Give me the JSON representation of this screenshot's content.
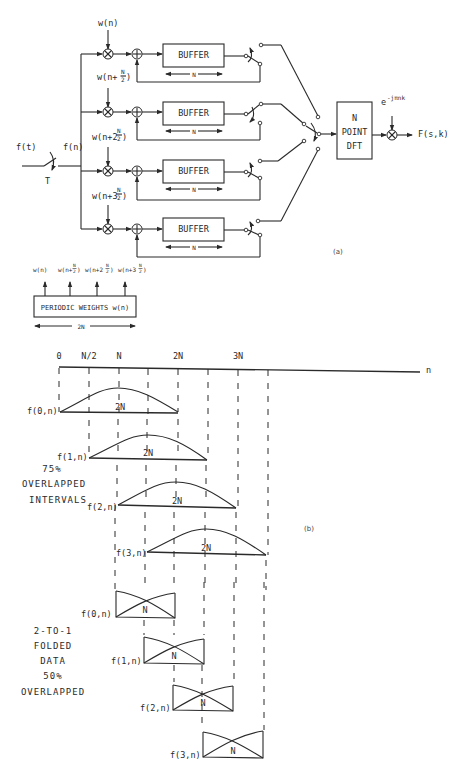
{
  "part_a": {
    "label": "(a)",
    "input_signal": "f(t)",
    "sampled_signal": "f(n)",
    "sampling_period": "T",
    "branches": [
      {
        "weight": "w(n)",
        "weight_base": "w(n",
        "weight_coef": "",
        "weight_suffix": ")",
        "buffer": "BUFFER",
        "length": "N"
      },
      {
        "weight": "w(n+N/2)",
        "weight_base": "w(n+",
        "weight_coef": "",
        "weight_suffix": ")",
        "buffer": "BUFFER",
        "length": "N"
      },
      {
        "weight": "w(n+2N/2)",
        "weight_base": "w(n+2",
        "weight_coef": "2",
        "weight_suffix": ")",
        "buffer": "BUFFER",
        "length": "N"
      },
      {
        "weight": "w(n+3N/2)",
        "weight_base": "w(n+3",
        "weight_coef": "3",
        "weight_suffix": ")",
        "buffer": "BUFFER",
        "length": "N"
      }
    ],
    "frac_num": "N",
    "frac_den": "2",
    "dft": {
      "line1": "N",
      "line2": "POINT",
      "line3": "DFT"
    },
    "twiddle": "e",
    "twiddle_exp": "-jπnk",
    "output": "F(s,k)",
    "weights_box": {
      "label": "PERIODIC WEIGHTS w(n)",
      "span": "2N",
      "outputs": [
        "w(n)",
        "w(n+N/2)",
        "w(n+2N/2)",
        "w(n+3N/2)"
      ]
    }
  },
  "part_b": {
    "label": "(b)",
    "axis_var": "n",
    "ticks": [
      "0",
      "N/2",
      "N",
      "2N",
      "3N"
    ],
    "overlap_label": [
      "75%",
      "OVERLAPPED",
      "INTERVALS"
    ],
    "windows": [
      {
        "name": "f(0,n)",
        "span": "2N"
      },
      {
        "name": "f(1,n)",
        "span": "2N"
      },
      {
        "name": "f(2,n)",
        "span": "2N"
      },
      {
        "name": "f(3,n)",
        "span": "2N"
      }
    ],
    "folded_label": [
      "2-TO-1",
      "FOLDED",
      "DATA",
      "50%",
      "OVERLAPPED"
    ],
    "folded": [
      {
        "name": "f(0,n)",
        "span": "N"
      },
      {
        "name": "f(1,n)",
        "span": "N"
      },
      {
        "name": "f(2,n)",
        "span": "N"
      },
      {
        "name": "f(3,n)",
        "span": "N"
      }
    ]
  }
}
